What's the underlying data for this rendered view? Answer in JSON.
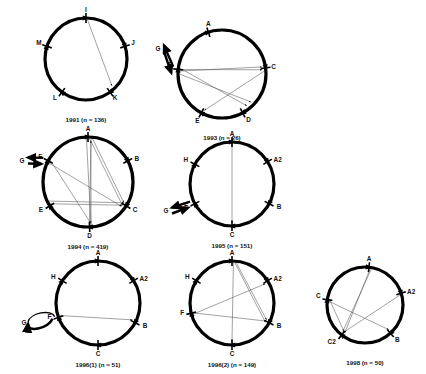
{
  "figure": {
    "type": "circular-genome-diagrams",
    "panel_count": 7,
    "background_color": "#ffffff",
    "stroke_color": "#000000"
  },
  "panels": [
    {
      "id": "panel-1991",
      "caption": "1991 (n = 136)",
      "year": "1991",
      "n": 136,
      "center": {
        "x": 86,
        "y": 59
      },
      "radius": 41,
      "nodes": [
        {
          "label": "I",
          "angle": -90,
          "label_dx": 0,
          "label_dy": -6
        },
        {
          "label": "J",
          "angle": -18,
          "label_dx": 8,
          "label_dy": -1
        },
        {
          "label": "K",
          "angle": 54,
          "label_dx": 5,
          "label_dy": 8
        },
        {
          "label": "L",
          "angle": 126,
          "label_dx": -7,
          "label_dy": 8
        },
        {
          "label": "M",
          "angle": 198,
          "label_dx": -8,
          "label_dy": -1
        }
      ],
      "chords": [
        {
          "from": -88,
          "to": 46
        }
      ],
      "external": null
    },
    {
      "id": "panel-1993",
      "caption": "1993 (n = 26)",
      "year": "1993",
      "n": 26,
      "center": {
        "x": 222,
        "y": 74
      },
      "radius": 44,
      "nodes": [
        {
          "label": "A",
          "angle": -108,
          "label_dx": 0,
          "label_dy": -6
        },
        {
          "label": "C",
          "angle": -8,
          "label_dx": 8,
          "label_dy": 1
        },
        {
          "label": "D",
          "angle": 62,
          "label_dx": 6,
          "label_dy": 9
        },
        {
          "label": "E",
          "angle": 118,
          "label_dx": -4,
          "label_dy": 10
        },
        {
          "label": "F",
          "angle": 186,
          "label_dx": -8,
          "label_dy": -2
        }
      ],
      "chords": [
        {
          "from": 184,
          "to": -10
        },
        {
          "from": 186,
          "to": -6
        },
        {
          "from": 188,
          "to": 52
        },
        {
          "from": -4,
          "to": 116
        },
        {
          "from": 180,
          "to": 44
        }
      ],
      "external": {
        "label": "G",
        "style": "double-arrow",
        "x": 158,
        "y": 48,
        "target": "F"
      }
    },
    {
      "id": "panel-1994",
      "caption": "1994 (n = 419)",
      "year": "1994",
      "n": 419,
      "center": {
        "x": 88,
        "y": 182
      },
      "radius": 45,
      "nodes": [
        {
          "label": "A",
          "angle": -90,
          "label_dx": 0,
          "label_dy": -6
        },
        {
          "label": "B",
          "angle": -28,
          "label_dx": 9,
          "label_dy": 0
        },
        {
          "label": "C",
          "angle": 32,
          "label_dx": 9,
          "label_dy": 6
        },
        {
          "label": "D",
          "angle": 88,
          "label_dx": 0,
          "label_dy": 11
        },
        {
          "label": "E",
          "angle": 148,
          "label_dx": -9,
          "label_dy": 6
        },
        {
          "label": "F",
          "angle": 208,
          "label_dx": -8,
          "label_dy": -2
        }
      ],
      "chords": [
        {
          "from": -92,
          "to": 86
        },
        {
          "from": -86,
          "to": 88
        },
        {
          "from": -88,
          "to": 34
        },
        {
          "from": -84,
          "to": 30
        },
        {
          "from": 206,
          "to": 36
        },
        {
          "from": 210,
          "to": 86
        },
        {
          "from": 154,
          "to": 30
        },
        {
          "from": 86,
          "to": -86
        },
        {
          "from": 150,
          "to": 34
        }
      ],
      "external": {
        "label": "G",
        "style": "double-arrow",
        "x": 22,
        "y": 160,
        "target": "F"
      }
    },
    {
      "id": "panel-1995",
      "caption": "1995 (n = 151)",
      "year": "1995",
      "n": 151,
      "center": {
        "x": 232,
        "y": 184
      },
      "radius": 42,
      "nodes": [
        {
          "label": "A",
          "angle": -90,
          "label_dx": 0,
          "label_dy": -6
        },
        {
          "label": "A2",
          "angle": -32,
          "label_dx": 10,
          "label_dy": 0
        },
        {
          "label": "B",
          "angle": 28,
          "label_dx": 10,
          "label_dy": 5
        },
        {
          "label": "C",
          "angle": 90,
          "label_dx": 0,
          "label_dy": 11
        },
        {
          "label": "F",
          "angle": 152,
          "label_dx": -9,
          "label_dy": 4
        },
        {
          "label": "H",
          "angle": 208,
          "label_dx": -9,
          "label_dy": -2
        }
      ],
      "chords": [
        {
          "from": -90,
          "to": 90
        }
      ],
      "external": {
        "label": "G",
        "style": "double-arrow",
        "x": 166,
        "y": 210,
        "target": "F"
      }
    },
    {
      "id": "panel-1996-1",
      "caption": "1996(1) (n = 51)",
      "year": "1996(1)",
      "n": 51,
      "center": {
        "x": 98,
        "y": 303
      },
      "radius": 42,
      "nodes": [
        {
          "label": "A",
          "angle": -90,
          "label_dx": 0,
          "label_dy": -6
        },
        {
          "label": "A2",
          "angle": -32,
          "label_dx": 10,
          "label_dy": 0
        },
        {
          "label": "B",
          "angle": 28,
          "label_dx": 10,
          "label_dy": 5
        },
        {
          "label": "C",
          "angle": 90,
          "label_dx": 0,
          "label_dy": 11
        },
        {
          "label": "F",
          "angle": 160,
          "label_dx": -9,
          "label_dy": 2
        },
        {
          "label": "H",
          "angle": 212,
          "label_dx": -9,
          "label_dy": -2
        }
      ],
      "chords": [
        {
          "from": 162,
          "to": 26
        }
      ],
      "external": {
        "label": "G",
        "style": "loop-arrow",
        "x": 24,
        "y": 322,
        "target": "F"
      }
    },
    {
      "id": "panel-1996-2",
      "caption": "1996(2) (n = 149)",
      "year": "1996(2)",
      "n": 149,
      "center": {
        "x": 232,
        "y": 303
      },
      "radius": 42,
      "nodes": [
        {
          "label": "A",
          "angle": -90,
          "label_dx": 0,
          "label_dy": -6
        },
        {
          "label": "A2",
          "angle": -32,
          "label_dx": 10,
          "label_dy": 0
        },
        {
          "label": "B",
          "angle": 28,
          "label_dx": 10,
          "label_dy": 5
        },
        {
          "label": "C",
          "angle": 90,
          "label_dx": 0,
          "label_dy": 11
        },
        {
          "label": "F",
          "angle": 166,
          "label_dx": -9,
          "label_dy": 2
        },
        {
          "label": "H",
          "angle": 212,
          "label_dx": -9,
          "label_dy": -2
        }
      ],
      "chords": [
        {
          "from": -88,
          "to": 90
        },
        {
          "from": -86,
          "to": 30
        },
        {
          "from": 164,
          "to": -30
        },
        {
          "from": 166,
          "to": 28
        },
        {
          "from": -84,
          "to": 26
        }
      ],
      "external": null
    },
    {
      "id": "panel-1998",
      "caption": "1998 (n = 50)",
      "year": "1998",
      "n": 50,
      "center": {
        "x": 365,
        "y": 305
      },
      "radius": 38,
      "nodes": [
        {
          "label": "A",
          "angle": -84,
          "label_dx": 0,
          "label_dy": -6
        },
        {
          "label": "A2",
          "angle": -18,
          "label_dx": 10,
          "label_dy": 1
        },
        {
          "label": "B",
          "angle": 48,
          "label_dx": 7,
          "label_dy": 9
        },
        {
          "label": "C2",
          "angle": 128,
          "label_dx": -10,
          "label_dy": 9
        },
        {
          "label": "C",
          "angle": 188,
          "label_dx": -9,
          "label_dy": -2
        }
      ],
      "chords": [
        {
          "from": -82,
          "to": 126
        },
        {
          "from": -80,
          "to": 130
        },
        {
          "from": 186,
          "to": 46
        },
        {
          "from": -16,
          "to": 128
        },
        {
          "from": 190,
          "to": 126
        }
      ],
      "external": null
    }
  ]
}
